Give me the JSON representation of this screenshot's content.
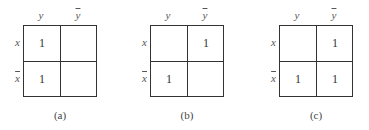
{
  "labels": {
    "col1": "y",
    "col2": "y",
    "row1": "x",
    "row2": "x"
  },
  "maps": [
    {
      "caption": "(a)",
      "cells": [
        [
          "1",
          ""
        ],
        [
          "1",
          ""
        ]
      ]
    },
    {
      "caption": "(b)",
      "cells": [
        [
          "",
          "1"
        ],
        [
          "1",
          ""
        ]
      ]
    },
    {
      "caption": "(c)",
      "cells": [
        [
          "",
          "1"
        ],
        [
          "1",
          "1"
        ]
      ]
    }
  ]
}
